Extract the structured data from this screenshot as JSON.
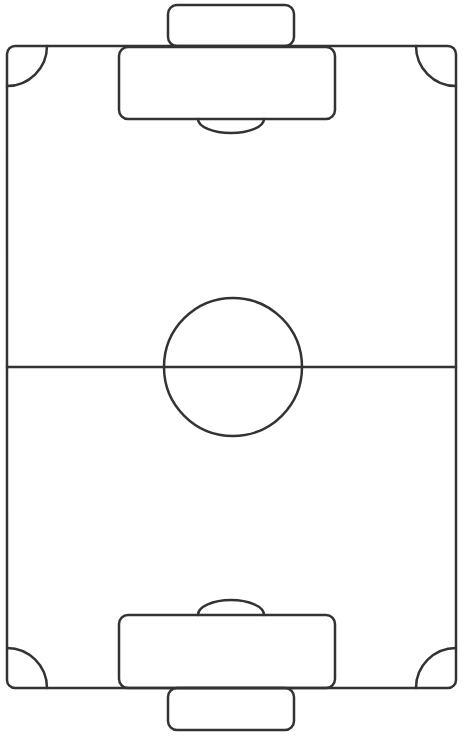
{
  "diagram": {
    "type": "soccer-pitch",
    "orientation": "vertical",
    "canvas": {
      "width": 464,
      "height": 739
    },
    "colors": {
      "background": "#ffffff",
      "line": "#333333"
    },
    "field": {
      "x": 7,
      "y": 46,
      "width": 449,
      "height": 642,
      "corner_radius": 8
    },
    "halfway_line": {
      "y": 367
    },
    "center_circle": {
      "cx": 233,
      "cy": 367,
      "r": 69
    },
    "top_goal": {
      "x": 168,
      "y": 5,
      "width": 126,
      "height": 41,
      "radius": 9
    },
    "top_penalty_box": {
      "x": 119,
      "y": 47,
      "width": 216,
      "height": 72,
      "radius": 9
    },
    "top_penalty_arc": {
      "cx": 231,
      "cy": 119,
      "rx": 33,
      "ry": 14
    },
    "bottom_goal": {
      "x": 168,
      "y": 688,
      "width": 126,
      "height": 42,
      "radius": 9
    },
    "bottom_penalty_box": {
      "x": 119,
      "y": 615,
      "width": 216,
      "height": 73,
      "radius": 9
    },
    "bottom_penalty_arc": {
      "cx": 231,
      "cy": 615,
      "rx": 33,
      "ry": 15
    },
    "corner_arcs": [
      {
        "position": "top-left"
      },
      {
        "position": "top-right"
      },
      {
        "position": "bottom-left"
      },
      {
        "position": "bottom-right"
      }
    ],
    "corner_arc_radius": 40
  }
}
